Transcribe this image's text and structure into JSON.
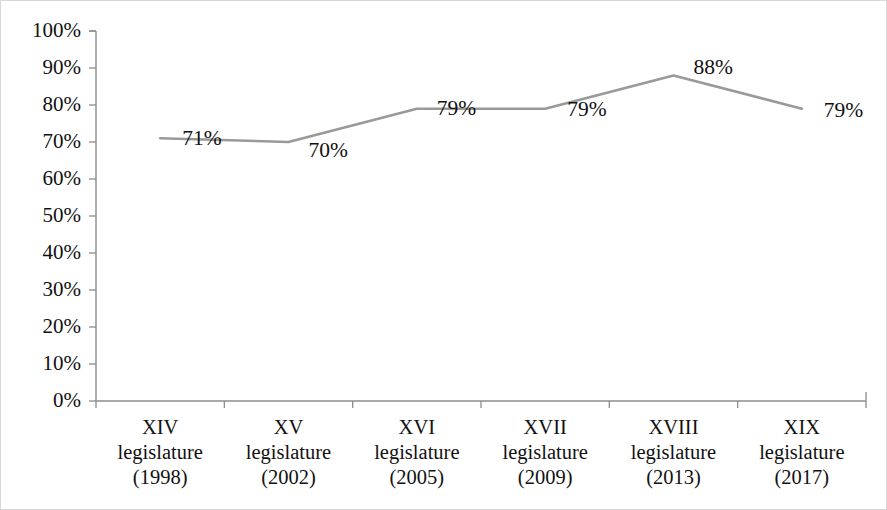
{
  "chart_data": {
    "type": "line",
    "title": "",
    "subtitle": "",
    "xlabel": "",
    "ylabel": "",
    "grid": false,
    "legend": "none",
    "ylim": [
      0,
      100
    ],
    "y_ticks": [
      "0%",
      "10%",
      "20%",
      "30%",
      "40%",
      "50%",
      "60%",
      "70%",
      "80%",
      "90%",
      "100%"
    ],
    "categories": [
      {
        "numeral": "XIV",
        "body": "legislature",
        "year": "(1998)"
      },
      {
        "numeral": "XV",
        "body": "legislature",
        "year": "(2002)"
      },
      {
        "numeral": "XVI",
        "body": "legislature",
        "year": "(2005)"
      },
      {
        "numeral": "XVII",
        "body": "legislature",
        "year": "(2009)"
      },
      {
        "numeral": "XVIII",
        "body": "legislature",
        "year": "(2013)"
      },
      {
        "numeral": "XIX",
        "body": "legislature",
        "year": "(2017)"
      }
    ],
    "values": [
      71,
      70,
      79,
      79,
      88,
      79
    ],
    "value_labels": [
      "71%",
      "70%",
      "79%",
      "79%",
      "88%",
      "79%"
    ],
    "series_color": "#999999",
    "axis_color": "#8c8c8c",
    "text_color": "#111111"
  }
}
